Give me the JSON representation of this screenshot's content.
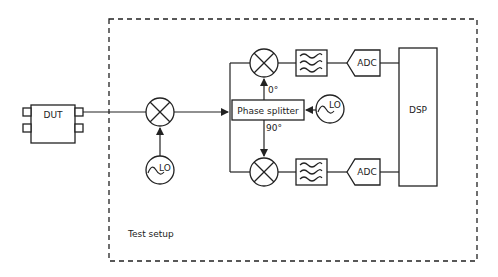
{
  "diagram": {
    "container": {
      "label": "Test setup",
      "style": "dashed"
    },
    "blocks": {
      "dut": {
        "label": "DUT"
      },
      "mixer_in": {
        "label": ""
      },
      "lo_in": {
        "label": "LO"
      },
      "phase_splitter": {
        "label": "Phase splitter"
      },
      "lo_splitter": {
        "label": "LO"
      },
      "phase_top": {
        "label": "0°"
      },
      "phase_bottom": {
        "label": "90°"
      },
      "adc_top": {
        "label": "ADC"
      },
      "adc_bottom": {
        "label": "ADC"
      },
      "dsp": {
        "label": "DSP"
      }
    },
    "colors": {
      "line": "#222222",
      "background": "#ffffff"
    }
  }
}
